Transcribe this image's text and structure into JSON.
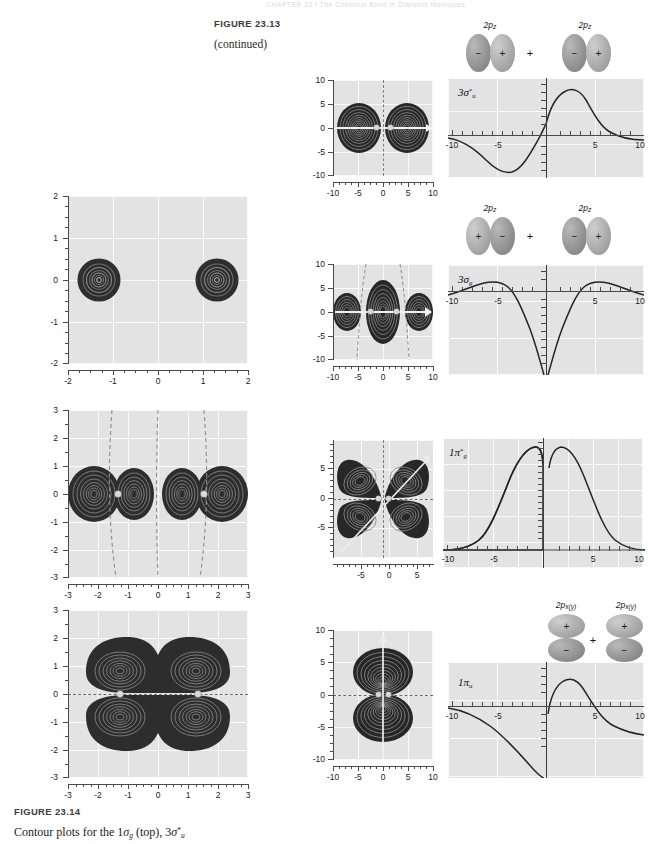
{
  "page": {
    "running_head": "CHAPTER 23 / The Chemical Bond in Diatomic Molecules",
    "width": 648,
    "height": 844
  },
  "captions": {
    "top": {
      "figure_label": "FIGURE  23.13",
      "continued": "(continued)"
    },
    "bottom": {
      "figure_label": "FIGURE  23.14",
      "line1_a": "Contour plots for the 1",
      "line1_sigma": "σ",
      "line1_sub_g": "g",
      "line1_b": " (top), 3",
      "line1_sigma2": "σ",
      "line1_sup": "*",
      "line1_sub_u": "u"
    }
  },
  "contour_plots": [
    {
      "name": "contour-1sigma-g",
      "xlabel_ticks": [
        "-2",
        "-1",
        "0",
        "1",
        "2"
      ],
      "ylabel_ticks": [
        "2",
        "1",
        "0",
        "-1",
        "-2"
      ],
      "xlim": [
        -2,
        2
      ],
      "ylim": [
        -2,
        2
      ],
      "nuclei_x": [
        -1.32,
        1.32
      ],
      "shape": "two-small-circles",
      "nodal_lines": []
    },
    {
      "name": "contour-3sigma-u-star",
      "xlabel_ticks": [
        "-3",
        "-2",
        "-1",
        "0",
        "1",
        "2",
        "3"
      ],
      "ylabel_ticks": [
        "3",
        "2",
        "1",
        "0",
        "-1",
        "-2",
        "-3"
      ],
      "xlim": [
        -3,
        3
      ],
      "ylim": [
        -3,
        3
      ],
      "nuclei_x": [
        -1.3,
        1.3
      ],
      "shape": "four-lobes-horizontal",
      "nodal_lines": [
        "vertical-dashed-x-1.35",
        "vertical-dashed-x0",
        "vertical-dashed-x+1.35"
      ]
    },
    {
      "name": "contour-1pi-u",
      "xlabel_ticks": [
        "-3",
        "-2",
        "-1",
        "0",
        "1",
        "2",
        "3"
      ],
      "ylabel_ticks": [
        "3",
        "2",
        "1",
        "0",
        "-1",
        "-2",
        "-3"
      ],
      "xlim": [
        -3,
        3
      ],
      "ylim": [
        -3,
        3
      ],
      "nuclei_x": [
        -1.3,
        1.3
      ],
      "shape": "pi-two-lobe-pairs",
      "nodal_lines": [
        "horizontal-dashed-y0"
      ]
    }
  ],
  "mo_rows": [
    {
      "id": "row-3sigma-u-star",
      "mo_label": "3σ*u",
      "mo_label_parts": {
        "n": "3",
        "sym": "σ",
        "star": "*",
        "sub": "u"
      },
      "contour": {
        "name": "contour-plot-3sigma-u-star",
        "x_ticks": [
          "-10",
          "-5",
          "0",
          "5",
          "10"
        ],
        "y_ticks": [
          "10",
          "5",
          "0",
          "-5",
          "-10"
        ],
        "nodal_line": "vertical-dashed-center"
      },
      "lineplot": {
        "name": "lineplot-3sigma-u-star",
        "x_ticks": [
          "-10",
          "-5",
          "5",
          "10"
        ],
        "curve": "antisymmetric-negative-then-positive"
      },
      "combination": {
        "left_label": "2pz",
        "right_label": "2pz",
        "operator": "+",
        "left_signs": [
          "−",
          "+"
        ],
        "right_signs": [
          "−",
          "+"
        ],
        "orientation": "horizontal"
      }
    },
    {
      "id": "row-3sigma-g",
      "mo_label": "3σg",
      "mo_label_parts": {
        "n": "3",
        "sym": "σ",
        "star": "",
        "sub": "g"
      },
      "contour": {
        "name": "contour-plot-3sigma-g",
        "x_ticks": [
          "-10",
          "-5",
          "0",
          "5",
          "10"
        ],
        "y_ticks": [
          "10",
          "5",
          "0",
          "-5",
          "-10"
        ],
        "nodal_line": "two-dashed-hyperbolic"
      },
      "lineplot": {
        "name": "lineplot-3sigma-g",
        "x_ticks": [
          "-10",
          "-5",
          "5",
          "10"
        ],
        "curve": "symmetric-two-humps-deep-well"
      },
      "combination": {
        "left_label": "2pz",
        "right_label": "2pz",
        "operator": "+",
        "left_signs": [
          "+",
          "−"
        ],
        "right_signs": [
          "−",
          "+"
        ],
        "orientation": "horizontal"
      }
    },
    {
      "id": "row-1pi-g-star",
      "mo_label": "1π*g",
      "mo_label_parts": {
        "n": "1",
        "sym": "π",
        "star": "*",
        "sub": "g"
      },
      "contour": {
        "name": "contour-plot-1pi-g-star",
        "x_ticks": [
          "-5",
          "0",
          "5"
        ],
        "y_ticks": [
          "5",
          "0",
          "-5"
        ],
        "nodal_line": "cross-dashed-and-diagonal"
      },
      "lineplot": {
        "name": "lineplot-1pi-g-star",
        "x_ticks": [
          "-10",
          "-5",
          "5",
          "10"
        ],
        "curve": "two-peaks-about-origin"
      },
      "combination": {
        "left_label": "2px(y)",
        "right_label": "2px(y)",
        "operator": "+",
        "left_signs": [
          "−",
          "+"
        ],
        "right_signs": [
          "+",
          "−"
        ],
        "orientation": "vertical"
      }
    },
    {
      "id": "row-1pi-u",
      "mo_label": "1πu",
      "mo_label_parts": {
        "n": "1",
        "sym": "π",
        "star": "",
        "sub": "u"
      },
      "contour": {
        "name": "contour-plot-1pi-u",
        "x_ticks": [
          "-10",
          "-5",
          "0",
          "5",
          "10"
        ],
        "y_ticks": [
          "10",
          "5",
          "0",
          "-5",
          "-10"
        ],
        "nodal_line": "horizontal-dashed-center"
      },
      "lineplot": {
        "name": "lineplot-1pi-u",
        "x_ticks": [
          "-10",
          "-5",
          "5",
          "10"
        ],
        "curve": "antisymmetric-negative-then-positive"
      },
      "combination": {
        "left_label": "2px(y)",
        "right_label": "2px(y)",
        "operator": "+",
        "left_signs": [
          "+",
          "−"
        ],
        "right_signs": [
          "+",
          "−"
        ],
        "orientation": "vertical"
      }
    }
  ],
  "colors": {
    "plot_background": "#e3e3e3",
    "gridline": "#fafafa",
    "contour_fill": "#2b2b2b",
    "axis": "#4a4a4a",
    "nucleus": "#d9d9d9"
  }
}
